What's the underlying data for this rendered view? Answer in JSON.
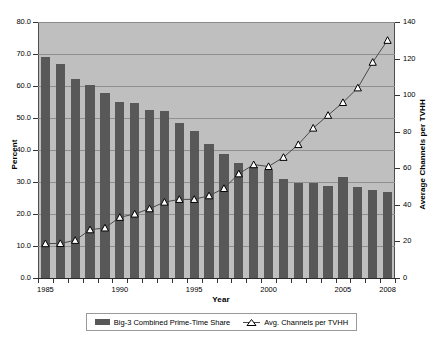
{
  "chart_data": {
    "type": "bar",
    "title": "",
    "xlabel": "Year",
    "ylabel": "Percent",
    "y2label": "Average Channels per TVHH",
    "grid": true,
    "legend_position": "bottom",
    "categories": [
      1985,
      1986,
      1987,
      1988,
      1989,
      1990,
      1991,
      1992,
      1993,
      1994,
      1995,
      1996,
      1997,
      1998,
      1999,
      2000,
      2001,
      2002,
      2003,
      2004,
      2005,
      2006,
      2007,
      2008
    ],
    "xticklabels": [
      "1985",
      "1990",
      "1995",
      "2000",
      "2005",
      "2008"
    ],
    "xtickvalues": [
      1985,
      1990,
      1995,
      2000,
      2005,
      2008
    ],
    "ylim": [
      0,
      80
    ],
    "yticks": [
      "0.0",
      "10.0",
      "20.0",
      "30.0",
      "40.0",
      "50.0",
      "60.0",
      "70.0",
      "80.0"
    ],
    "ytickvalues": [
      0,
      10,
      20,
      30,
      40,
      50,
      60,
      70,
      80
    ],
    "y2lim": [
      0,
      140
    ],
    "y2ticks": [
      "0",
      "20",
      "40",
      "60",
      "80",
      "100",
      "120",
      "140"
    ],
    "y2tickvalues": [
      0,
      20,
      40,
      60,
      80,
      100,
      120,
      140
    ],
    "series": [
      {
        "name": "Big-3 Combined Prime-Time Share",
        "type": "bar",
        "axis": "left",
        "color": "#585858",
        "values": [
          69.1,
          66.9,
          62.1,
          60.3,
          57.9,
          55.0,
          54.8,
          52.6,
          52.1,
          48.5,
          46.0,
          42.0,
          38.6,
          36.0,
          34.6,
          33.7,
          31.0,
          29.8,
          29.8,
          28.7,
          31.5,
          28.5,
          27.6,
          26.8
        ]
      },
      {
        "name": "Avg. Channels per TVHH",
        "type": "line",
        "axis": "right",
        "color": "#4a4a4a",
        "marker": "triangle",
        "values": [
          18.8,
          18.9,
          20.6,
          26.4,
          27.4,
          33.2,
          35.0,
          37.9,
          41.5,
          43.0,
          43.0,
          45.0,
          49.0,
          57.0,
          62.0,
          61.0,
          66.0,
          73.0,
          82.0,
          89.0,
          96.0,
          104.0,
          118.0,
          130.0
        ]
      }
    ]
  },
  "legend": {
    "entries": [
      {
        "label": "Big-3 Combined Prime-Time Share"
      },
      {
        "label": "Avg. Channels per TVHH"
      }
    ]
  }
}
